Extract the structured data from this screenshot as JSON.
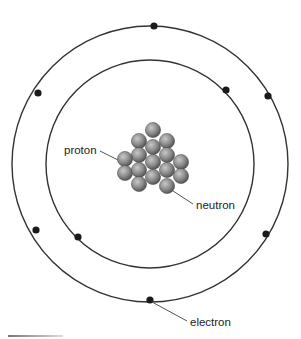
{
  "diagram": {
    "labels": {
      "proton": "proton",
      "neutron": "neutron",
      "electron": "electron"
    },
    "colors": {
      "orbit": "#333333",
      "electron": "#1a1a1a",
      "nucleon_light": "#bdbdbd",
      "nucleon_dark": "#5a5a5a",
      "leader_line": "#555555"
    },
    "orbits": [
      {
        "name": "inner",
        "cx": 150,
        "cy": 164,
        "r": 104
      },
      {
        "name": "outer",
        "cx": 150,
        "cy": 164,
        "r": 138
      }
    ],
    "electrons": [
      {
        "x": 154,
        "y": 26
      },
      {
        "x": 268,
        "y": 96
      },
      {
        "x": 226,
        "y": 90
      },
      {
        "x": 38,
        "y": 93
      },
      {
        "x": 36,
        "y": 230
      },
      {
        "x": 78,
        "y": 237
      },
      {
        "x": 266,
        "y": 234
      },
      {
        "x": 150,
        "y": 300
      }
    ],
    "nucleons": [
      {
        "x": 153,
        "y": 130
      },
      {
        "x": 139,
        "y": 141
      },
      {
        "x": 167,
        "y": 141
      },
      {
        "x": 153,
        "y": 147
      },
      {
        "x": 139,
        "y": 155
      },
      {
        "x": 167,
        "y": 155
      },
      {
        "x": 125,
        "y": 159
      },
      {
        "x": 181,
        "y": 162
      },
      {
        "x": 153,
        "y": 162
      },
      {
        "x": 125,
        "y": 173
      },
      {
        "x": 139,
        "y": 170
      },
      {
        "x": 167,
        "y": 170
      },
      {
        "x": 181,
        "y": 176
      },
      {
        "x": 153,
        "y": 177
      },
      {
        "x": 139,
        "y": 184
      },
      {
        "x": 167,
        "y": 186
      }
    ]
  }
}
